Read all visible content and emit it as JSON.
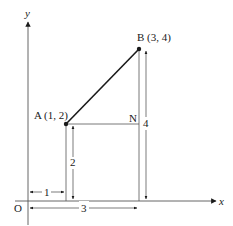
{
  "diagram": {
    "axes": {
      "x_label": "x",
      "y_label": "y",
      "origin_label": "O"
    },
    "points": {
      "A": {
        "label": "A (1, 2)",
        "x": 1,
        "y": 2
      },
      "B": {
        "label": "B (3, 4)",
        "x": 3,
        "y": 4
      },
      "N": {
        "label": "N"
      }
    },
    "dimensions": {
      "horizontal_1": "1",
      "horizontal_3": "3",
      "vertical_2": "2",
      "vertical_4": "4"
    },
    "colors": {
      "line": "#2a2a2a",
      "segment": "#1a1a1a",
      "background": "#ffffff"
    }
  }
}
